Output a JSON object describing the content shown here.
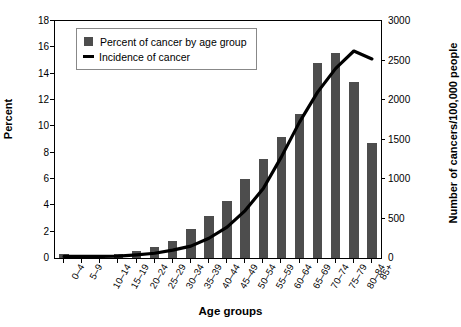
{
  "chart_data": {
    "type": "bar",
    "title": "",
    "xlabel": "Age groups",
    "ylabel": "Percent",
    "ylabel_right": "Number of cancers/100,000 people",
    "ylim": [
      0,
      18
    ],
    "ylim_right": [
      0,
      3000
    ],
    "yticks": [
      0,
      2,
      4,
      6,
      8,
      10,
      12,
      14,
      16,
      18
    ],
    "yticks_right": [
      0,
      500,
      1000,
      1500,
      2000,
      2500,
      3000
    ],
    "grid": false,
    "legend_position": "top-left",
    "categories": [
      "0–4",
      "5–9",
      "10–14",
      "15–19",
      "20–24",
      "25–29",
      "30–34",
      "35–39",
      "40–44",
      "45–49",
      "50–54",
      "55–59",
      "60–64",
      "65–69",
      "70–74",
      "75–79",
      "80–84",
      "85+"
    ],
    "series": [
      {
        "name": "Percent of cancer by age group",
        "type": "bar",
        "axis": "left",
        "color": "#4d4d4d",
        "values": [
          0.3,
          0.2,
          0.2,
          0.3,
          0.5,
          0.8,
          1.3,
          2.2,
          3.2,
          4.3,
          6.0,
          7.5,
          9.2,
          10.9,
          14.8,
          15.6,
          13.4,
          8.7
        ]
      },
      {
        "name": "Incidence of cancer",
        "type": "line",
        "axis": "right",
        "color": "#000000",
        "values": [
          20,
          20,
          20,
          25,
          40,
          60,
          100,
          150,
          250,
          390,
          600,
          880,
          1280,
          1720,
          2100,
          2400,
          2620,
          2520
        ]
      }
    ],
    "legend": [
      {
        "label": "Percent of cancer by age group",
        "marker": "square",
        "color": "#4d4d4d"
      },
      {
        "label": "Incidence of cancer",
        "marker": "line",
        "color": "#000000"
      }
    ]
  }
}
